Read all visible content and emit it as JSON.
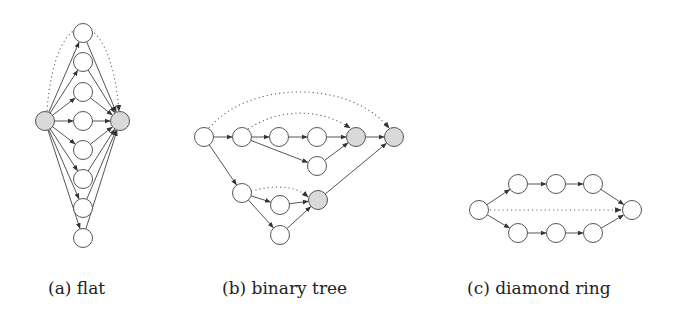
{
  "colors": {
    "node_fill": "#ffffff",
    "highlight_fill": "#d9d9d9",
    "stroke": "#555555"
  },
  "node_radius": 9.5,
  "subfigures": [
    {
      "id": "flat",
      "caption": "(a) flat",
      "caption_x": 48,
      "nodes": [
        {
          "id": "s",
          "x": 45,
          "y": 121,
          "highlight": true
        },
        {
          "id": "t",
          "x": 120,
          "y": 121,
          "highlight": true
        },
        {
          "id": "m1",
          "x": 83,
          "y": 33
        },
        {
          "id": "m2",
          "x": 83,
          "y": 62
        },
        {
          "id": "m3",
          "x": 83,
          "y": 92
        },
        {
          "id": "m4",
          "x": 83,
          "y": 121
        },
        {
          "id": "m5",
          "x": 83,
          "y": 150
        },
        {
          "id": "m6",
          "x": 83,
          "y": 179
        },
        {
          "id": "m7",
          "x": 83,
          "y": 208
        },
        {
          "id": "m8",
          "x": 83,
          "y": 238
        }
      ],
      "edges": [
        [
          "s",
          "m1"
        ],
        [
          "s",
          "m2"
        ],
        [
          "s",
          "m3"
        ],
        [
          "s",
          "m4"
        ],
        [
          "s",
          "m5"
        ],
        [
          "s",
          "m6"
        ],
        [
          "s",
          "m7"
        ],
        [
          "s",
          "m8"
        ],
        [
          "m1",
          "t"
        ],
        [
          "m2",
          "t"
        ],
        [
          "m3",
          "t"
        ],
        [
          "m4",
          "t"
        ],
        [
          "m5",
          "t"
        ],
        [
          "m6",
          "t"
        ],
        [
          "m7",
          "t"
        ],
        [
          "m8",
          "t"
        ]
      ],
      "dotted": [
        {
          "from": "s",
          "to": "t",
          "path": "M 47 111 C 55 0, 110 0, 119 111"
        }
      ]
    },
    {
      "id": "binary-tree",
      "caption": "(b) binary tree",
      "caption_x": 222,
      "nodes": [
        {
          "id": "r",
          "x": 204,
          "y": 137
        },
        {
          "id": "a1",
          "x": 242,
          "y": 137
        },
        {
          "id": "a2",
          "x": 279,
          "y": 137
        },
        {
          "id": "a3",
          "x": 317,
          "y": 137
        },
        {
          "id": "g1",
          "x": 356,
          "y": 137,
          "highlight": true
        },
        {
          "id": "g2",
          "x": 394,
          "y": 137,
          "highlight": true
        },
        {
          "id": "b1",
          "x": 317,
          "y": 166
        },
        {
          "id": "c1",
          "x": 242,
          "y": 193
        },
        {
          "id": "c2",
          "x": 280,
          "y": 205
        },
        {
          "id": "g3",
          "x": 318,
          "y": 200,
          "highlight": true
        },
        {
          "id": "c3",
          "x": 280,
          "y": 235
        }
      ],
      "edges": [
        [
          "r",
          "a1"
        ],
        [
          "a1",
          "a2"
        ],
        [
          "a2",
          "a3"
        ],
        [
          "a3",
          "g1"
        ],
        [
          "g1",
          "g2"
        ],
        [
          "a1",
          "b1"
        ],
        [
          "b1",
          "g1"
        ],
        [
          "r",
          "c1"
        ],
        [
          "c1",
          "c2"
        ],
        [
          "c1",
          "c3"
        ],
        [
          "c2",
          "g3"
        ],
        [
          "c3",
          "g3"
        ],
        [
          "g3",
          "g2"
        ]
      ],
      "dotted": [
        {
          "from": "r",
          "to": "g2",
          "path": "M 209 128 C 250 80, 350 80, 389 128"
        },
        {
          "from": "a1",
          "to": "g1",
          "path": "M 248 129 C 280 108, 320 108, 350 128"
        },
        {
          "from": "c1",
          "to": "g3",
          "path": "M 251 191 C 275 185, 295 185, 308 197"
        }
      ]
    },
    {
      "id": "diamond-ring",
      "caption": "(c) diamond ring",
      "caption_x": 467,
      "nodes": [
        {
          "id": "l",
          "x": 479,
          "y": 210
        },
        {
          "id": "u1",
          "x": 518,
          "y": 184
        },
        {
          "id": "u2",
          "x": 556,
          "y": 184
        },
        {
          "id": "u3",
          "x": 593,
          "y": 184
        },
        {
          "id": "d1",
          "x": 518,
          "y": 233
        },
        {
          "id": "d2",
          "x": 556,
          "y": 233
        },
        {
          "id": "d3",
          "x": 593,
          "y": 233
        },
        {
          "id": "rr",
          "x": 632,
          "y": 210
        }
      ],
      "edges": [
        [
          "l",
          "u1"
        ],
        [
          "u1",
          "u2"
        ],
        [
          "u2",
          "u3"
        ],
        [
          "u3",
          "rr"
        ],
        [
          "l",
          "d1"
        ],
        [
          "d1",
          "d2"
        ],
        [
          "d2",
          "d3"
        ],
        [
          "d3",
          "rr"
        ]
      ],
      "dotted": [
        {
          "from": "l",
          "to": "rr",
          "path": "M 490 210 L 621 210"
        }
      ]
    }
  ]
}
